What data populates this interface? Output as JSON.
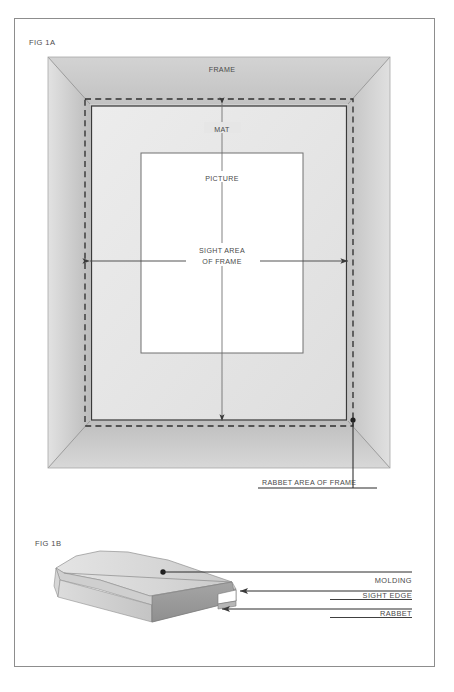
{
  "document": {
    "title": "Picture Frame Terminology Diagram",
    "background_color": "#ffffff",
    "border_color": "#8a8a8a"
  },
  "figures": [
    {
      "id": "fig-1a",
      "label": "FIG 1A",
      "description": "Front view of a matted picture inside a frame",
      "labels": {
        "frame": "FRAME",
        "mat": "MAT",
        "picture": "PICTURE",
        "sight_area_line1": "SIGHT AREA",
        "sight_area_line2": "OF FRAME",
        "rabbet_area": "RABBET AREA OF FRAME"
      }
    },
    {
      "id": "fig-1b",
      "label": "FIG 1B",
      "description": "Perspective view of a length of frame molding",
      "callouts": [
        {
          "name": "molding",
          "label": "MOLDING"
        },
        {
          "name": "sight-edge",
          "label": "SIGHT EDGE"
        },
        {
          "name": "rabbet",
          "label": "RABBET"
        }
      ]
    }
  ],
  "colors": {
    "frame_face_light": "#dedede",
    "frame_face_mid": "#cdcdcd",
    "frame_face_dark": "#bdbdbd",
    "mat_light": "#eeeeee",
    "mat_mid": "#e3e3e3",
    "picture_white": "#ffffff",
    "line_dark": "#3a3a3a",
    "line_mid": "#6f6f6f",
    "text": "#4a4a4a",
    "molding_top": "#d9d9d9",
    "molding_front": "#9c9c9c",
    "molding_side": "#c6c6c6"
  }
}
